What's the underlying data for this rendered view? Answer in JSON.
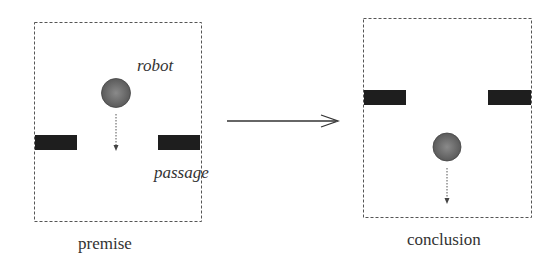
{
  "panels": {
    "premise": {
      "caption": "premise",
      "robot_label": "robot",
      "passage_label": "passage"
    },
    "conclusion": {
      "caption": "conclusion"
    }
  },
  "colors": {
    "bar": "#1e1e1e",
    "robot": "#6a6a6a",
    "frame": "#555555",
    "arrow": "#333333"
  }
}
